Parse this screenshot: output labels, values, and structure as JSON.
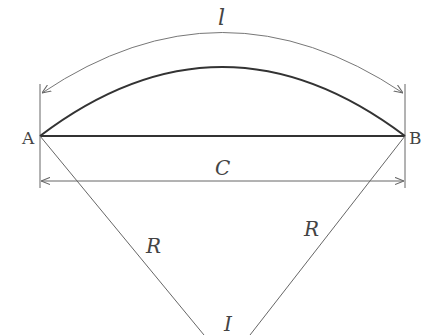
{
  "diagram": {
    "labels": {
      "arc_length": "l",
      "point_a": "A",
      "point_b": "B",
      "chord": "C",
      "radius_left": "R",
      "radius_right": "R",
      "angle": "I"
    },
    "colors": {
      "stroke_main": "#333333",
      "stroke_thin": "#666666",
      "text": "#444444"
    }
  }
}
